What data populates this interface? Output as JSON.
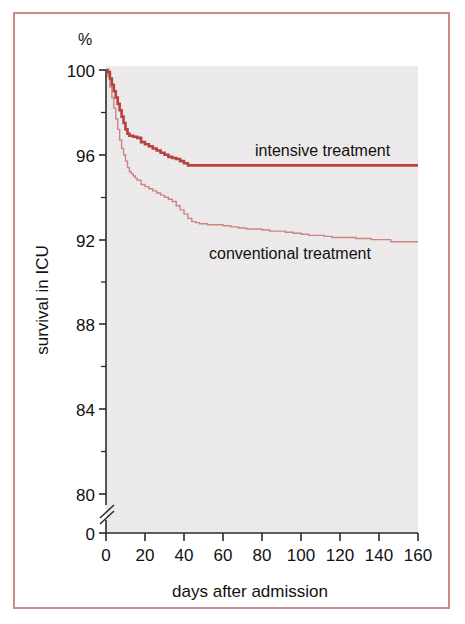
{
  "figure": {
    "border_color": "#c98b8b",
    "plot_background": "#eceaea",
    "axis_color": "#2b2b2b",
    "page_background": "#ffffff"
  },
  "chart_data": {
    "type": "line",
    "title": "",
    "subtitle": "",
    "xlabel": "days after admission",
    "ylabel": "survival in ICU",
    "unit_label": "%",
    "xlim": [
      0,
      160
    ],
    "ylim": [
      79,
      100
    ],
    "y_axis_break": true,
    "y_break_labels": [
      "80",
      "0"
    ],
    "grid": false,
    "legend_position": "inline-right",
    "xticks": [
      0,
      20,
      40,
      60,
      80,
      100,
      120,
      140,
      160
    ],
    "xtick_labels": [
      "0",
      "20",
      "40",
      "60",
      "80",
      "100",
      "120",
      "140",
      "160"
    ],
    "yticks": [
      80,
      84,
      88,
      92,
      96,
      100
    ],
    "ytick_labels": [
      "80",
      "84",
      "88",
      "92",
      "96",
      "100"
    ],
    "ytick_minor": [
      82,
      86,
      90,
      94,
      98
    ],
    "origin_label": "0",
    "annotations": [
      {
        "name": "intensive-treatment-label",
        "text": "intensive treatment",
        "x": 76,
        "y": 96.6
      },
      {
        "name": "conventional-treatment-label",
        "text": "conventional treatment",
        "x": 56,
        "y": 91.6
      }
    ],
    "series": [
      {
        "name": "intensive treatment",
        "label": "intensive treatment",
        "color": "#b5433f",
        "linewidth": 2.6,
        "step": "post",
        "final_value": 95.5,
        "x": [
          0,
          1,
          2,
          3,
          4,
          5,
          6,
          7,
          8,
          9,
          10,
          11,
          12,
          14,
          16,
          18,
          20,
          22,
          24,
          26,
          28,
          30,
          32,
          34,
          36,
          38,
          40,
          42,
          160
        ],
        "y": [
          100.0,
          99.9,
          99.6,
          99.3,
          99.0,
          98.7,
          98.4,
          98.1,
          97.8,
          97.5,
          97.2,
          97.0,
          96.9,
          96.85,
          96.8,
          96.6,
          96.5,
          96.4,
          96.3,
          96.2,
          96.1,
          96.0,
          95.9,
          95.85,
          95.8,
          95.7,
          95.6,
          95.5,
          95.5
        ]
      },
      {
        "name": "conventional treatment",
        "label": "conventional treatment",
        "color": "#cc8584",
        "linewidth": 1.4,
        "step": "post",
        "final_value": 91.9,
        "x": [
          0,
          1,
          2,
          3,
          4,
          5,
          6,
          7,
          8,
          9,
          10,
          11,
          12,
          13,
          14,
          15,
          16,
          18,
          20,
          22,
          24,
          26,
          28,
          30,
          32,
          34,
          36,
          38,
          40,
          42,
          44,
          46,
          48,
          52,
          56,
          60,
          64,
          68,
          72,
          76,
          80,
          84,
          88,
          92,
          96,
          100,
          104,
          108,
          112,
          116,
          120,
          128,
          136,
          144,
          146,
          160
        ],
        "y": [
          100.0,
          99.7,
          99.2,
          98.7,
          98.2,
          97.7,
          97.2,
          96.7,
          96.3,
          96.0,
          95.7,
          95.4,
          95.2,
          95.1,
          95.0,
          94.9,
          94.8,
          94.6,
          94.5,
          94.4,
          94.3,
          94.2,
          94.1,
          94.0,
          93.9,
          93.8,
          93.6,
          93.4,
          93.2,
          93.0,
          92.85,
          92.8,
          92.75,
          92.7,
          92.7,
          92.65,
          92.6,
          92.55,
          92.5,
          92.5,
          92.45,
          92.4,
          92.4,
          92.35,
          92.3,
          92.25,
          92.2,
          92.2,
          92.15,
          92.1,
          92.1,
          92.05,
          92.0,
          92.0,
          91.9,
          91.9
        ]
      }
    ]
  }
}
